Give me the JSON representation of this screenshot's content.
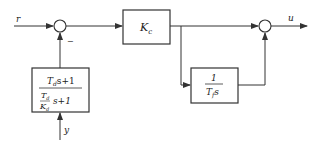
{
  "diagram": {
    "type": "block-diagram",
    "colors": {
      "line": "#333333",
      "background": "#ffffff"
    },
    "signals": {
      "input": "r",
      "output": "u",
      "measurement": "y"
    },
    "summing_junctions": [
      {
        "id": "sum1",
        "sign_label": "−"
      },
      {
        "id": "sum2",
        "sign_label": ""
      }
    ],
    "blocks": {
      "controller_gain": {
        "main": "K",
        "sub": "c"
      },
      "integrator": {
        "numerator": "1",
        "den_main": "T",
        "den_sub": "f",
        "den_var": "s"
      },
      "feedback_filter": {
        "numerator": {
          "main": "T",
          "sub": "d",
          "rest": "s+1"
        },
        "denominator": {
          "frac_num_main": "T",
          "frac_num_sub": "d",
          "frac_den_main": "K",
          "frac_den_sub": "d",
          "rest": "s+1"
        }
      }
    }
  }
}
